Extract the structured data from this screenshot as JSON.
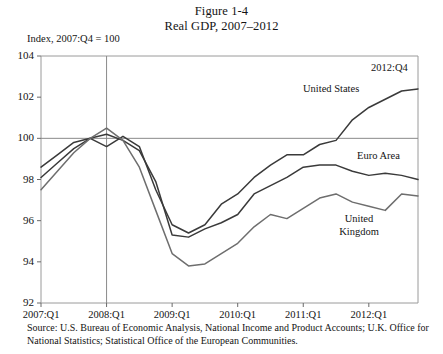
{
  "figure": {
    "label": "Figure 1-4",
    "title": "Real GDP, 2007–2012",
    "axis_note": "Index, 2007:Q4 = 100",
    "source": "Source: U.S. Bureau of Economic Analysis, National Income and Product Accounts; U.K. Office for National Statistics; Statistical Office of the European Communities."
  },
  "annotations": {
    "united_states": "United States",
    "euro_area": "Euro Area",
    "united_kingdom_line1": "United",
    "united_kingdom_line2": "Kingdom",
    "endpoint": "2012:Q4"
  },
  "chart_data": {
    "type": "line",
    "title": "Real GDP, 2007–2012",
    "subtitle": "Figure 1-4",
    "xlabel": "",
    "ylabel": "Index, 2007:Q4 = 100",
    "ylim": [
      92,
      104
    ],
    "yticks": [
      92,
      94,
      96,
      98,
      100,
      102,
      104
    ],
    "xticks": [
      "2007:Q1",
      "2008:Q1",
      "2009:Q1",
      "2010:Q1",
      "2011:Q1",
      "2012:Q1"
    ],
    "grid": false,
    "reference_lines": [
      {
        "axis": "y",
        "value": 100
      },
      {
        "axis": "x",
        "value": "2008:Q1"
      }
    ],
    "legend_position": "inline-annotations",
    "x": [
      "2007:Q1",
      "2007:Q2",
      "2007:Q3",
      "2007:Q4",
      "2008:Q1",
      "2008:Q2",
      "2008:Q3",
      "2008:Q4",
      "2009:Q1",
      "2009:Q2",
      "2009:Q3",
      "2009:Q4",
      "2010:Q1",
      "2010:Q2",
      "2010:Q3",
      "2010:Q4",
      "2011:Q1",
      "2011:Q2",
      "2011:Q3",
      "2011:Q4",
      "2012:Q1",
      "2012:Q2",
      "2012:Q3",
      "2012:Q4"
    ],
    "series": [
      {
        "name": "United States",
        "color": "#3a3a3a",
        "values": [
          98.6,
          99.2,
          99.8,
          100.0,
          99.6,
          100.1,
          99.6,
          97.5,
          95.8,
          95.4,
          95.8,
          96.8,
          97.3,
          98.1,
          98.7,
          99.2,
          99.2,
          99.7,
          99.9,
          100.9,
          101.5,
          101.9,
          102.3,
          102.4
        ]
      },
      {
        "name": "Euro Area",
        "color": "#3a3a3a",
        "values": [
          98.1,
          98.8,
          99.5,
          100.0,
          100.2,
          99.9,
          99.4,
          97.9,
          95.3,
          95.2,
          95.6,
          95.9,
          96.3,
          97.3,
          97.7,
          98.1,
          98.6,
          98.7,
          98.7,
          98.4,
          98.2,
          98.3,
          98.2,
          98.0
        ]
      },
      {
        "name": "United Kingdom",
        "color": "#6e6e6e",
        "values": [
          97.5,
          98.4,
          99.3,
          100.0,
          100.5,
          99.9,
          98.6,
          96.5,
          94.4,
          93.8,
          93.9,
          94.4,
          94.9,
          95.7,
          96.3,
          96.1,
          96.6,
          97.1,
          97.3,
          96.9,
          96.7,
          96.5,
          97.3,
          97.2
        ]
      }
    ]
  },
  "plot_geometry": {
    "left": 41,
    "right": 418,
    "top": 56,
    "bottom": 303
  }
}
